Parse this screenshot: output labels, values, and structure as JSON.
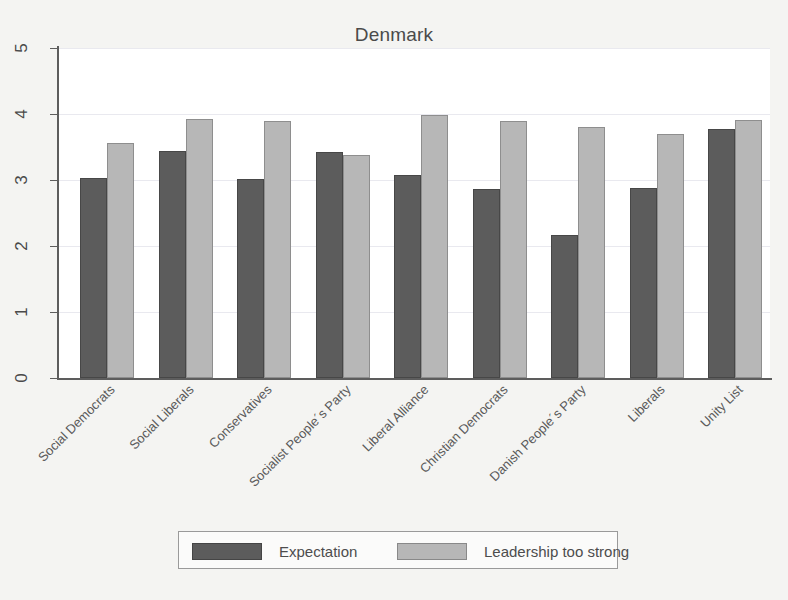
{
  "chart_data": {
    "type": "bar",
    "title": "Denmark",
    "xlabel": "",
    "ylabel": "",
    "ylim": [
      0,
      5
    ],
    "yticks": [
      0,
      1,
      2,
      3,
      4,
      5
    ],
    "grid": true,
    "legend_position": "bottom",
    "categories": [
      "Social Democrats",
      "Social Liberals",
      "Conservatives",
      "Socialist People´s Party",
      "Liberal Alliance",
      "Christian Democrats",
      "Danish People´s Party",
      "Liberals",
      "Unity List"
    ],
    "series": [
      {
        "name": "Expectation",
        "color": "#5c5c5c",
        "values": [
          3.03,
          3.44,
          3.01,
          3.42,
          3.08,
          2.86,
          2.17,
          2.88,
          3.78
        ]
      },
      {
        "name": "Leadership too strong",
        "color": "#b7b7b7",
        "values": [
          3.56,
          3.92,
          3.89,
          3.38,
          3.99,
          3.9,
          3.8,
          3.69,
          3.91
        ]
      }
    ]
  },
  "legend": {
    "entries": [
      {
        "label": "Expectation"
      },
      {
        "label": "Leadership too strong"
      }
    ]
  }
}
